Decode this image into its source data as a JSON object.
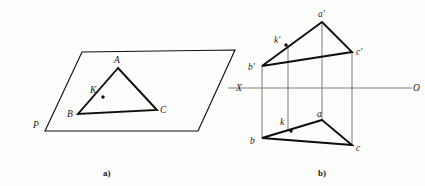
{
  "figure": {
    "caption_a": "a)",
    "caption_b": "b)",
    "panel_a": {
      "name": "pictorial-view",
      "plane_label": "P",
      "triangle_labels": {
        "a": "A",
        "b": "B",
        "c": "C",
        "k": "K"
      },
      "plane_points": "45,131 82,52 235,50 198,131",
      "triangle_points": "118,68 78,114 157,110",
      "point_k": {
        "x": 103,
        "y": 97
      },
      "label_positions": {
        "A": {
          "x": 114,
          "y": 63
        },
        "B": {
          "x": 67,
          "y": 117
        },
        "C": {
          "x": 160,
          "y": 113
        },
        "K": {
          "x": 90,
          "y": 93
        },
        "P": {
          "x": 33,
          "y": 128
        }
      }
    },
    "panel_b": {
      "name": "orthographic-projection",
      "axis_left_label": "X",
      "axis_right_label": "O",
      "vertical_projection_label": "",
      "ground_line": {
        "x1": 228,
        "y1": 88,
        "x2": 412,
        "y2": 88
      },
      "upper_triangle_labels": {
        "a": "a'",
        "b": "b'",
        "c": "c'",
        "k": "k'"
      },
      "lower_triangle_labels": {
        "a": "a",
        "b": "b",
        "c": "c",
        "k": "k"
      },
      "upper_triangle_points": "322,22 262,66 352,52",
      "lower_triangle_points": "322,120 262,138 352,145",
      "point_k_upper": {
        "x": 286,
        "y": 45
      },
      "point_k_lower": {
        "x": 293,
        "y": 131
      },
      "projectors": [
        {
          "x": 262,
          "y1": 66,
          "y2": 138
        },
        {
          "x": 288,
          "y1": 45,
          "y2": 130
        },
        {
          "x": 322,
          "y1": 22,
          "y2": 120
        },
        {
          "x": 352,
          "y1": 52,
          "y2": 145
        }
      ],
      "label_positions": {
        "a_prime": {
          "x": 318,
          "y": 17
        },
        "b_prime": {
          "x": 249,
          "y": 70
        },
        "c_prime": {
          "x": 356,
          "y": 54
        },
        "k_prime": {
          "x": 275,
          "y": 43
        },
        "a": {
          "x": 318,
          "y": 116
        },
        "b": {
          "x": 251,
          "y": 143
        },
        "c": {
          "x": 356,
          "y": 150
        },
        "k": {
          "x": 281,
          "y": 124
        },
        "X": {
          "x": 237,
          "y": 91
        },
        "O": {
          "x": 414,
          "y": 91
        }
      },
      "caption_positions": {
        "a": {
          "x": 103,
          "y": 175
        },
        "b": {
          "x": 318,
          "y": 175
        }
      }
    }
  },
  "colors": {
    "ink": "#0d0d0d",
    "projector_gray": "#7a7a7a",
    "background": "#fdfdfc"
  }
}
